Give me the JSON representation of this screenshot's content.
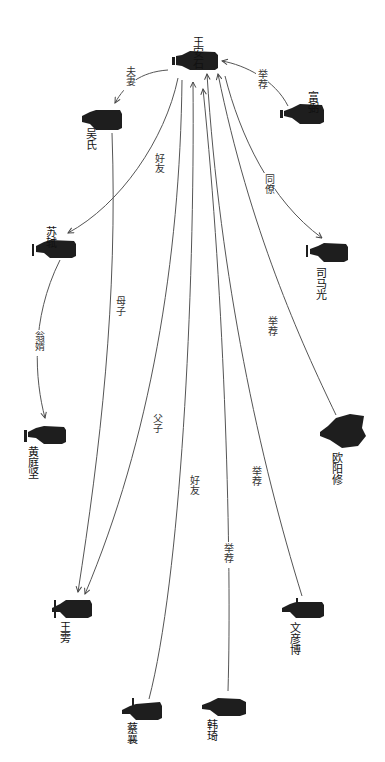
{
  "diagram": {
    "orientation": "rotated-90-clockwise",
    "center": "王安石",
    "nodes": [
      {
        "id": "wang_anshi",
        "name": "王安石"
      },
      {
        "id": "fu_bi",
        "name": "富弼"
      },
      {
        "id": "wu_shi",
        "name": "吴氏"
      },
      {
        "id": "su_shi",
        "name": "苏轼"
      },
      {
        "id": "sima_guang",
        "name": "司马光"
      },
      {
        "id": "huang_tingjian",
        "name": "黄庭坚"
      },
      {
        "id": "ouyang_xiu",
        "name": "欧阳修"
      },
      {
        "id": "wang_pang",
        "name": "王雱"
      },
      {
        "id": "wen_yanbo",
        "name": "文彦博"
      },
      {
        "id": "cai_xiang",
        "name": "蔡襄"
      },
      {
        "id": "han_qi",
        "name": "韩琦"
      }
    ],
    "edges": [
      {
        "from": "王安石",
        "to": "吴氏",
        "label": "夫妻"
      },
      {
        "from": "富弼",
        "to": "王安石",
        "label": "举荐"
      },
      {
        "from": "王安石",
        "to": "苏轼",
        "label": "好友"
      },
      {
        "from": "王安石",
        "to": "司马光",
        "label": "同僚"
      },
      {
        "from": "苏轼",
        "to": "黄庭坚",
        "label": "翁婿"
      },
      {
        "from": "吴氏",
        "to": "王雱",
        "label": "母子"
      },
      {
        "from": "王安石",
        "to": "王雱",
        "label": "父子"
      },
      {
        "from": "欧阳修",
        "to": "王安石",
        "label": "举荐"
      },
      {
        "from": "文彦博",
        "to": "王安石",
        "label": "举荐"
      },
      {
        "from": "蔡襄",
        "to": "王安石",
        "label": "好友"
      },
      {
        "from": "韩琦",
        "to": "王安石",
        "label": "举荐"
      }
    ]
  }
}
